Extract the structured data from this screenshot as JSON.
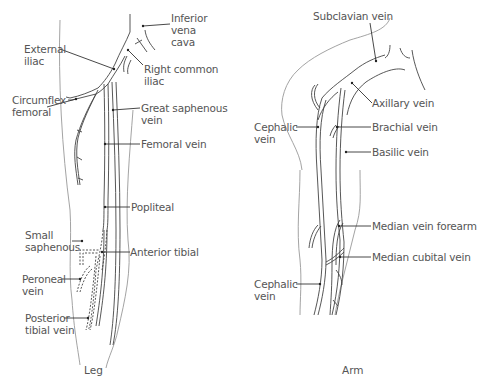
{
  "leg": {
    "caption": "Leg",
    "labels": {
      "inferior_vena_cava": "Inferior\nvena\ncava",
      "external_iliac": "External\niliac",
      "right_common_iliac": "Right common\niliac",
      "circumflex_femoral": "Circumflex\nfemoral",
      "great_saphenous_vein": "Great saphenous\nvein",
      "femoral_vein": "Femoral vein",
      "popliteal": "Popliteal",
      "small_saphenous": "Small\nsaphenous",
      "anterior_tibial": "Anterior tibial",
      "peroneal_vein": "Peroneal\nvein",
      "posterior_tibial_vein": "Posterior\ntibial vein"
    }
  },
  "arm": {
    "caption": "Arm",
    "labels": {
      "subclavian_vein": "Subclavian vein",
      "axillary_vein": "Axillary vein",
      "cephalic_vein_upper": "Cephalic\nvein",
      "brachial_vein": "Brachial vein",
      "basilic_vein": "Basilic vein",
      "median_vein_forearm": "Median vein forearm",
      "median_cubital_vein": "Median cubital vein",
      "cephalic_vein_lower": "Cephalic\nvein"
    }
  },
  "colors": {
    "text": "#555555",
    "vein_lines": "#444444",
    "outline": "#999999"
  }
}
